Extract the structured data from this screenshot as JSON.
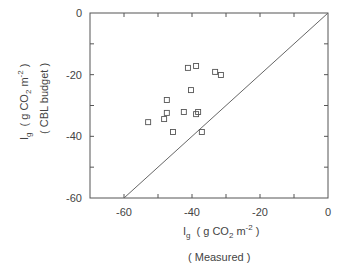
{
  "chart_data": {
    "type": "scatter",
    "title": "",
    "xlabel": "I_g ( g CO2 m^-2 )",
    "xlabel_sub": "( Measured )",
    "ylabel": "I_g ( g CO2 m^-2 )",
    "ylabel_sub": "( CBL budget )",
    "xlim": [
      -70,
      0
    ],
    "ylim": [
      -60,
      0
    ],
    "x_ticks": [
      -60,
      -40,
      -20,
      0
    ],
    "y_ticks": [
      0,
      -20,
      -40,
      -60
    ],
    "grid": false,
    "legend": null,
    "reference_line": {
      "label": "1:1 line",
      "from": [
        -60,
        -60
      ],
      "to": [
        0,
        0
      ]
    },
    "series": [
      {
        "name": "data",
        "marker": "open-square",
        "points": [
          {
            "x": -41.2,
            "y": -17.8
          },
          {
            "x": -38.8,
            "y": -17.2
          },
          {
            "x": -33.2,
            "y": -19.1
          },
          {
            "x": -31.5,
            "y": -20.1
          },
          {
            "x": -40.3,
            "y": -25.0
          },
          {
            "x": -47.4,
            "y": -28.2
          },
          {
            "x": -47.4,
            "y": -32.4
          },
          {
            "x": -42.4,
            "y": -32.1
          },
          {
            "x": -38.2,
            "y": -32.1
          },
          {
            "x": -38.8,
            "y": -32.8
          },
          {
            "x": -52.9,
            "y": -35.4
          },
          {
            "x": -48.2,
            "y": -34.4
          },
          {
            "x": -45.6,
            "y": -38.6
          },
          {
            "x": -37.1,
            "y": -38.6
          }
        ]
      }
    ]
  },
  "labels": {
    "x_tick_labels": [
      "-60",
      "-40",
      "-20",
      "0"
    ],
    "y_tick_labels": [
      "0",
      "-20",
      "-40",
      "-60"
    ],
    "x_axis": {
      "main": "I",
      "sub": "g",
      "unit_open": "( g CO",
      "unit_sub": "2",
      "unit_mid": " m",
      "unit_sup": "-2",
      "unit_close": " )",
      "caption": "( Measured )"
    },
    "y_axis": {
      "main": "I",
      "sub": "g",
      "unit_open": "( g CO",
      "unit_sub": "2",
      "unit_mid": " m",
      "unit_sup": "-2",
      "unit_close": " )",
      "caption": "( CBL budget )"
    }
  },
  "colors": {
    "axis": "#555555",
    "marker": "#555555",
    "line": "#666666"
  }
}
